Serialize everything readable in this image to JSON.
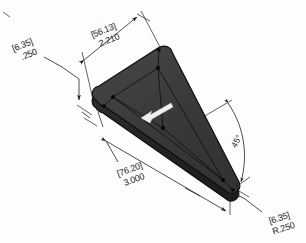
{
  "drawing": {
    "title": "Isometric triangular plate dimensioned drawing",
    "background_color": "#fdfdfd",
    "part": {
      "name": "triangular-plate",
      "top_face_color": "#3c3c3c",
      "side_face_color": "#2a2a2a",
      "edge_color": "#0d0d0d",
      "direction_arrow": "left-pointing-white-arrow",
      "direction_arrow_color": "#f2f2f2"
    },
    "dimensions": [
      {
        "id": "thickness",
        "name": "thickness-dimension",
        "metric": "[6.35]",
        "imperial": ".250",
        "position": "upper-left",
        "type": "linear"
      },
      {
        "id": "short-side",
        "name": "short-side-dimension",
        "metric": "[56.13]",
        "imperial": "2.210",
        "position": "top",
        "type": "linear"
      },
      {
        "id": "base-length",
        "name": "base-length-dimension",
        "metric": "[76.20]",
        "imperial": "3.000",
        "position": "bottom-left",
        "type": "linear"
      },
      {
        "id": "corner-angle",
        "name": "corner-angle-dimension",
        "value": "45°",
        "position": "right",
        "type": "angular"
      },
      {
        "id": "corner-radius",
        "name": "corner-radius-dimension",
        "metric": "[6.35]",
        "imperial": "R.250",
        "position": "bottom-right",
        "type": "radial"
      }
    ]
  }
}
